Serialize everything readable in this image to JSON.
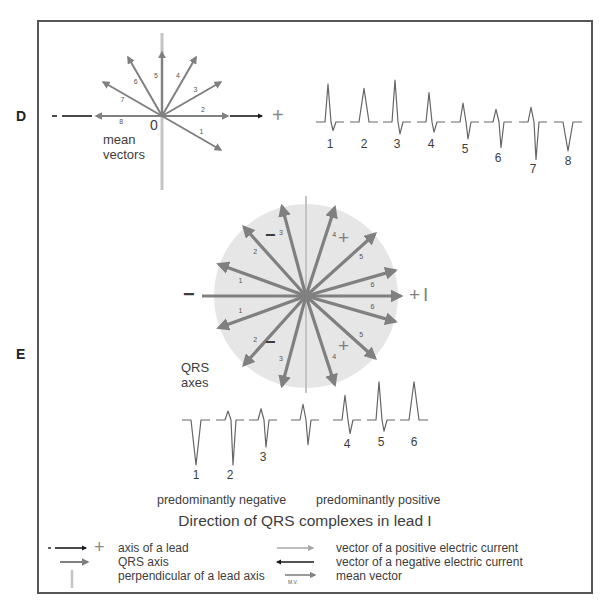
{
  "panels": {
    "d": {
      "label": "D",
      "origin_label": "0",
      "caption_line1": "mean",
      "caption_line2": "vectors",
      "axis_minus": "-",
      "axis_plus": "+",
      "vectors": [
        {
          "id": "1",
          "angle_deg": -30
        },
        {
          "id": "2",
          "angle_deg": 0
        },
        {
          "id": "3",
          "angle_deg": 30
        },
        {
          "id": "4",
          "angle_deg": 60
        },
        {
          "id": "5",
          "angle_deg": 90
        },
        {
          "id": "6",
          "angle_deg": 120
        },
        {
          "id": "7",
          "angle_deg": 150
        },
        {
          "id": "8",
          "angle_deg": 180
        }
      ],
      "complexes": [
        {
          "label": "1",
          "r": 0.9,
          "s": 0.25
        },
        {
          "label": "2",
          "r": 0.8,
          "s": 0.0
        },
        {
          "label": "3",
          "r": 1.0,
          "s": 0.35
        },
        {
          "label": "4",
          "r": 0.7,
          "s": 0.3
        },
        {
          "label": "5",
          "r": 0.45,
          "s": 0.5
        },
        {
          "label": "6",
          "r": 0.3,
          "s": 0.75
        },
        {
          "label": "7",
          "r": 0.35,
          "s": 1.1
        },
        {
          "label": "8",
          "r": 0.0,
          "s": 0.85
        }
      ]
    },
    "e": {
      "label": "E",
      "axis_minus": "−",
      "axis_plus": "+",
      "axis_lead": "I",
      "sign_neg_top": "−",
      "sign_neg_bottom": "−",
      "sign_pos_top": "+",
      "sign_pos_bottom": "+",
      "caption_line1": "QRS",
      "caption_line2": "axes",
      "axes": [
        {
          "id": "1",
          "angle_deg": 160
        },
        {
          "id": "1",
          "angle_deg": 200
        },
        {
          "id": "2",
          "angle_deg": 132
        },
        {
          "id": "2",
          "angle_deg": 228
        },
        {
          "id": "3",
          "angle_deg": 105
        },
        {
          "id": "3",
          "angle_deg": 255
        },
        {
          "id": "4",
          "angle_deg": 72
        },
        {
          "id": "4",
          "angle_deg": 288
        },
        {
          "id": "5",
          "angle_deg": 42
        },
        {
          "id": "5",
          "angle_deg": 318
        },
        {
          "id": "6",
          "angle_deg": 16
        },
        {
          "id": "6",
          "angle_deg": 344
        }
      ],
      "complexes": [
        {
          "label": "1",
          "r": 0.0,
          "s": 1.0
        },
        {
          "label": "2",
          "r": 0.2,
          "s": 1.0
        },
        {
          "label": "3",
          "r": 0.25,
          "s": 0.6
        },
        {
          "label": "",
          "r": 0.35,
          "s": 0.55
        },
        {
          "label": "4",
          "r": 0.55,
          "s": 0.3
        },
        {
          "label": "5",
          "r": 0.85,
          "s": 0.25
        },
        {
          "label": "6",
          "r": 0.85,
          "s": 0.0
        }
      ],
      "group_negative": "predominantly negative",
      "group_positive": "predominantly positive",
      "title": "Direction of QRS complexes in lead I"
    }
  },
  "legend": {
    "items": [
      {
        "icon": "lead-axis-arrow-icon",
        "text": "axis of a lead"
      },
      {
        "icon": "qrs-axis-arrow-icon",
        "text": "QRS axis"
      },
      {
        "icon": "perpendicular-line-icon",
        "text": "perpendicular of a lead axis"
      },
      {
        "icon": "positive-vector-arrow-icon",
        "text": "vector of a positive electric current"
      },
      {
        "icon": "negative-vector-arrow-icon",
        "text": "vector of a negative electric current"
      },
      {
        "icon": "mean-vector-arrow-icon",
        "text": "mean vector"
      }
    ],
    "lead_minus": "-",
    "lead_plus": "+",
    "mv_tag": "M.V."
  },
  "colors": {
    "vector": "#808080",
    "axis_black": "#1a1a1a",
    "perpendicular": "#c4c4c4",
    "circle_fill": "#e6e6e6",
    "text": "#3d3d3d",
    "plus_sign": "#8a8a8a"
  }
}
